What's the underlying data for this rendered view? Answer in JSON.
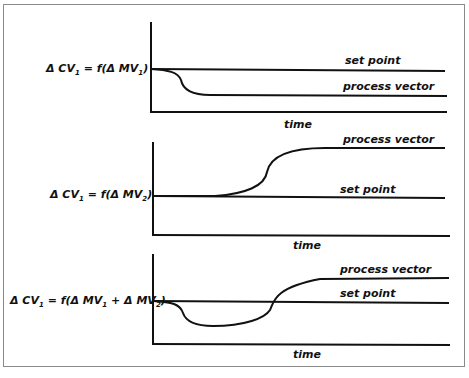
{
  "diagram": {
    "panels": [
      {
        "equation": "ΔCV1 = f(ΔMV1)",
        "equation_parts": {
          "lhs": "Δ CV",
          "lhs_sub": "1",
          "mid": " = f(Δ MV",
          "mid_sub": "1",
          "tail": ")"
        },
        "set_point_label": "set point",
        "process_vector_label": "process vector",
        "x_axis_label": "time",
        "behavior": "process vector drops below set point and settles lower"
      },
      {
        "equation": "ΔCV1 = f(ΔMV2)",
        "equation_parts": {
          "lhs": "Δ CV",
          "lhs_sub": "1",
          "mid": " = f(Δ MV",
          "mid_sub": "2",
          "tail": ")"
        },
        "set_point_label": "set point",
        "process_vector_label": "process vector",
        "x_axis_label": "time",
        "behavior": "process vector rises above set point and settles higher"
      },
      {
        "equation": "ΔCV1 = f(ΔMV1 + ΔMV2)",
        "equation_parts": {
          "lhs": "Δ CV",
          "lhs_sub": "1",
          "mid": " = f(Δ MV",
          "mid_sub": "1",
          "mid2": " + Δ MV",
          "mid2_sub": "2",
          "tail": ")"
        },
        "set_point_label": "set point",
        "process_vector_label": "process vector",
        "x_axis_label": "time",
        "behavior": "process vector dips below, then rises above set point"
      }
    ],
    "colors": {
      "line": "#111111",
      "frame": "#8a8a8a",
      "background": "#ffffff"
    }
  }
}
